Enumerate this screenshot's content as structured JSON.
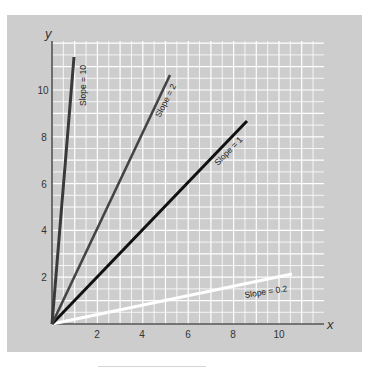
{
  "chart_data": {
    "type": "line",
    "title": "",
    "xlabel": "x",
    "ylabel": "y",
    "xlim": [
      0,
      12
    ],
    "ylim": [
      0,
      12
    ],
    "x_ticks": [
      2,
      4,
      6,
      8,
      10
    ],
    "y_ticks": [
      2,
      4,
      6,
      8,
      10
    ],
    "grid": true,
    "grid_step": 0.5,
    "legend": "inline labels along lines",
    "series": [
      {
        "name": "SLOPE = 10",
        "label": "Slope = 10",
        "slope": 10,
        "color": "#3a3a3a",
        "x": [
          0,
          0.97
        ],
        "y": [
          0,
          11.4
        ]
      },
      {
        "name": "SLOPE = 2",
        "label": "Slope = 2",
        "slope": 2,
        "color": "#444444",
        "x": [
          0,
          5.2
        ],
        "y": [
          0,
          10.6
        ]
      },
      {
        "name": "SLOPE = 1",
        "label": "Slope = 1",
        "slope": 1,
        "color": "#111111",
        "x": [
          0,
          8.6
        ],
        "y": [
          0,
          8.7
        ]
      },
      {
        "name": "SLOPE = 0.2",
        "label": "Slope = 0.2",
        "slope": 0.2,
        "color": "#ffffff",
        "x": [
          0,
          10.6
        ],
        "y": [
          0,
          2.1
        ]
      }
    ]
  },
  "axes": {
    "x_label": "x",
    "y_label": "y",
    "x_tick_labels": [
      "2",
      "4",
      "6",
      "8",
      "10"
    ],
    "y_tick_labels": [
      "2",
      "4",
      "6",
      "8",
      "10"
    ]
  },
  "labels": {
    "slope10": "Slope = 10",
    "slope2": "Slope = 2",
    "slope1": "Slope = 1",
    "slope02": "Slope = 0.2"
  },
  "colors": {
    "panel": "#cdcdcd",
    "grid": "#ffffff",
    "axis": "#555555"
  }
}
